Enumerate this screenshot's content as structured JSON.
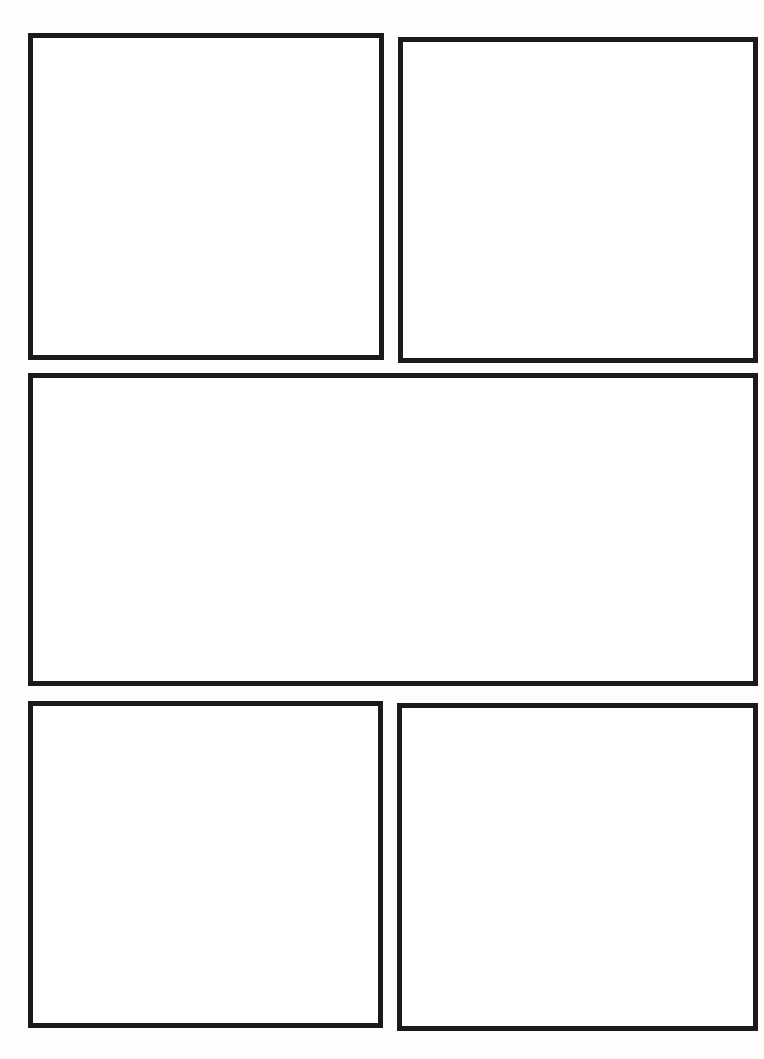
{
  "page": {
    "type": "comic-page-template",
    "background_color": "#ffffff",
    "border_color": "#1a1a1a",
    "panels": [
      {
        "id": "panel-1",
        "row": 1,
        "position": "left",
        "content": ""
      },
      {
        "id": "panel-2",
        "row": 1,
        "position": "right",
        "content": ""
      },
      {
        "id": "panel-3",
        "row": 2,
        "position": "full-width",
        "content": ""
      },
      {
        "id": "panel-4",
        "row": 3,
        "position": "left",
        "content": ""
      },
      {
        "id": "panel-5",
        "row": 3,
        "position": "right",
        "content": ""
      }
    ]
  }
}
